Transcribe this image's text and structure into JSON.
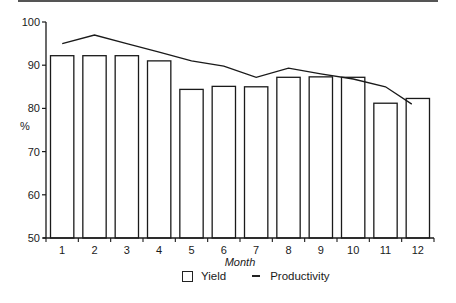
{
  "chart_data": {
    "type": "bar",
    "title": "",
    "xlabel": "Month",
    "ylabel": "%",
    "categories": [
      "1",
      "2",
      "3",
      "4",
      "5",
      "6",
      "7",
      "8",
      "9",
      "10",
      "11",
      "12"
    ],
    "series": [
      {
        "name": "Yield",
        "type": "bar",
        "values": [
          92.2,
          92.2,
          92.2,
          91.0,
          84.4,
          85.1,
          85.0,
          87.2,
          87.3,
          87.2,
          81.2,
          82.3
        ]
      },
      {
        "name": "Productivity",
        "type": "line",
        "values": [
          95.0,
          97.0,
          95.0,
          93.0,
          91.0,
          89.8,
          87.2,
          89.3,
          88.0,
          86.8,
          85.0,
          81.0
        ]
      }
    ],
    "ylim": [
      50,
      100
    ],
    "yticks": [
      50,
      60,
      70,
      80,
      90,
      100
    ],
    "grid": false,
    "legend_position": "bottom"
  },
  "axes": {
    "y_label": "%",
    "x_label": "Month",
    "y_ticks": [
      "50",
      "60",
      "70",
      "80",
      "90",
      "100"
    ],
    "x_ticks": [
      "1",
      "2",
      "3",
      "4",
      "5",
      "6",
      "7",
      "8",
      "9",
      "10",
      "11",
      "12"
    ]
  },
  "legend": {
    "yield_label": "Yield",
    "productivity_label": "Productivity"
  },
  "colors": {
    "ink": "#1a1a1a",
    "bar_fill": "#ffffff"
  }
}
